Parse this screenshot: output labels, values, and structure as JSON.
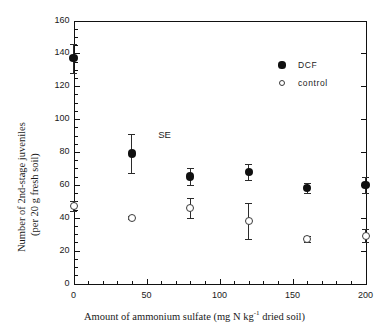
{
  "figure": {
    "background": "#ffffff",
    "frame_color": "#111111"
  },
  "chart_data": {
    "type": "scatter",
    "title": "",
    "xlabel": "Amount of ammonium sulfate (mg N kg⁻¹ dried soil)",
    "xlabel_parts": {
      "prefix": "Amount of ammonium sulfate (mg N kg",
      "exponent": "-1",
      "suffix": " dried soil)"
    },
    "ylabel": "Number of 2nd-stage juveniles (per 20 g fresh soil)",
    "ylabel_line1": "Number of 2nd-stage juveniles",
    "ylabel_line2": "(per 20 g fresh soil)",
    "xlim": [
      0,
      200
    ],
    "ylim": [
      0,
      160
    ],
    "xticks": [
      0,
      50,
      100,
      150,
      200
    ],
    "xtick_labels": [
      "0",
      "50",
      "100",
      "150",
      "200"
    ],
    "yticks": [
      0,
      20,
      40,
      60,
      80,
      100,
      120,
      140,
      160
    ],
    "ytick_labels": [
      "0",
      "20",
      "40",
      "60",
      "80",
      "100",
      "120",
      "140",
      "160"
    ],
    "x_minor_interval": 10,
    "y_minor_interval": 5,
    "grid": false,
    "legend_position": "upper-right-inside",
    "x": [
      0,
      40,
      80,
      120,
      160,
      200
    ],
    "series": [
      {
        "name": "DCF",
        "marker": "filled-circle",
        "color": "#101010",
        "values": [
          137,
          79,
          65,
          68,
          58,
          60
        ],
        "errors": [
          9,
          12,
          5,
          5,
          3,
          5
        ]
      },
      {
        "name": "control",
        "marker": "open-circle",
        "color": "#3a3a3a",
        "values": [
          47,
          40,
          46,
          38,
          27,
          29
        ],
        "errors": [
          3,
          1,
          6,
          11,
          2,
          4
        ]
      }
    ],
    "annotations": [
      {
        "text": "SE",
        "x": 58,
        "y": 90
      }
    ]
  },
  "legend": {
    "entries": [
      {
        "label": "DCF",
        "marker": "filled-circle"
      },
      {
        "label": "control",
        "marker": "open-circle"
      }
    ]
  }
}
